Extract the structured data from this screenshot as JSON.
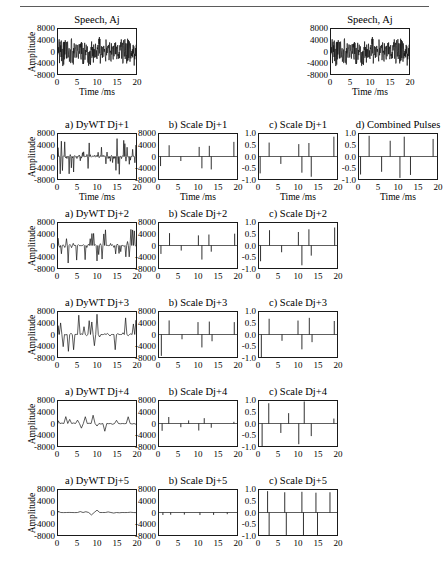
{
  "figure": {
    "axis_titles": {
      "x": "Time /ms",
      "y": "Amplitude"
    },
    "amp_ticks": [
      "8000",
      "4000",
      "0",
      "-4000",
      "-8000"
    ],
    "scale_ticks": [
      "1.0",
      "0.5",
      "0.0",
      "-0.5",
      "-1.0"
    ],
    "x_ticks": [
      "0",
      "5",
      "10",
      "15",
      "20"
    ]
  },
  "header": {
    "left": {
      "title": "Speech, Aj"
    },
    "right": {
      "title": "Speech, Aj"
    }
  },
  "rows": [
    {
      "key": "dj1",
      "panels": [
        {
          "title": "a) DyWT Dj+1",
          "kind": "amp"
        },
        {
          "title": "b) Scale Dj+1",
          "kind": "amp"
        },
        {
          "title": "c) Scale Dj+1",
          "kind": "scale"
        },
        {
          "title": "d) Combined Pulses",
          "kind": "scale"
        }
      ]
    },
    {
      "key": "dj2",
      "panels": [
        {
          "title": "a) DyWT Dj+2",
          "kind": "amp"
        },
        {
          "title": "b) Scale Dj+2",
          "kind": "amp"
        },
        {
          "title": "c) Scale Dj+2",
          "kind": "scale"
        }
      ]
    },
    {
      "key": "dj3",
      "panels": [
        {
          "title": "a) DyWT Dj+3",
          "kind": "amp"
        },
        {
          "title": "b) Scale Dj+3",
          "kind": "amp"
        },
        {
          "title": "c) Scale Dj+3",
          "kind": "scale"
        }
      ]
    },
    {
      "key": "dj4",
      "panels": [
        {
          "title": "a) DyWT Dj+4",
          "kind": "amp"
        },
        {
          "title": "b) Scale Dj+4",
          "kind": "amp"
        },
        {
          "title": "c) Scale Dj+4",
          "kind": "scale"
        }
      ]
    },
    {
      "key": "dj5",
      "panels": [
        {
          "title": "a) DyWT Dj+5",
          "kind": "amp"
        },
        {
          "title": "b) Scale Dj+5",
          "kind": "amp"
        },
        {
          "title": "c) Scale Dj+5",
          "kind": "scale"
        }
      ]
    }
  ],
  "chart_data": {
    "type": "line",
    "xlabel": "Time /ms",
    "ylabel": "Amplitude",
    "xlim": [
      0,
      20
    ],
    "x_ticks": [
      0,
      5,
      10,
      15,
      20
    ],
    "amplitude_ylim": [
      -8000,
      8000
    ],
    "amplitude_yticks": [
      8000,
      4000,
      0,
      -4000,
      -8000
    ],
    "scale_ylim": [
      -1.0,
      1.0
    ],
    "scale_yticks": [
      1.0,
      0.5,
      0.0,
      -0.5,
      -1.0
    ],
    "grid": false,
    "legend": "none",
    "panels": [
      {
        "id": "speech-left",
        "title": "Speech, Aj",
        "ylabel": "Amplitude",
        "ylim": [
          -8000,
          8000
        ],
        "series_type": "waveform",
        "description": "Noisy speech waveform oscillating roughly between -5500 and 5500 over 0-20 ms"
      },
      {
        "id": "speech-right",
        "title": "Speech, Aj",
        "ylabel": "Amplitude",
        "ylim": [
          -8000,
          8000
        ],
        "series_type": "waveform",
        "description": "Same speech waveform repeated at right of header row"
      },
      {
        "id": "dj1-a",
        "title": "a) DyWT Dj+1",
        "ylim": [
          -8000,
          8000
        ],
        "series_type": "wavelet-detail",
        "description": "Dense high-frequency detail coefficients, spikes up to about +6000 near 9 ms and 19 ms"
      },
      {
        "id": "dj1-b",
        "title": "b) Scale Dj+1",
        "ylim": [
          -8000,
          8000
        ],
        "series_type": "pulses",
        "pulses": [
          {
            "t": 0.4,
            "v": -3400
          },
          {
            "t": 2.6,
            "v": 4000
          },
          {
            "t": 5.6,
            "v": -1600
          },
          {
            "t": 10.3,
            "v": 3400
          },
          {
            "t": 11.0,
            "v": -4200
          },
          {
            "t": 12.9,
            "v": 3800
          },
          {
            "t": 13.4,
            "v": -4600
          },
          {
            "t": 19.2,
            "v": 5200
          }
        ]
      },
      {
        "id": "dj1-c",
        "title": "c) Scale Dj+1",
        "ylim": [
          -1.0,
          1.0
        ],
        "series_type": "pulses",
        "pulses": [
          {
            "t": 0.3,
            "v": -0.75
          },
          {
            "t": 2.6,
            "v": 0.62
          },
          {
            "t": 5.6,
            "v": -0.33
          },
          {
            "t": 10.2,
            "v": 0.55
          },
          {
            "t": 11.0,
            "v": -0.72
          },
          {
            "t": 12.8,
            "v": 0.6
          },
          {
            "t": 13.4,
            "v": -0.9
          },
          {
            "t": 19.2,
            "v": 0.88
          }
        ]
      },
      {
        "id": "dj1-d",
        "title": "d) Combined Pulses",
        "ylim": [
          -1.0,
          1.0
        ],
        "series_type": "pulses",
        "pulses": [
          {
            "t": 0.4,
            "v": -0.8
          },
          {
            "t": 2.6,
            "v": 0.92
          },
          {
            "t": 5.8,
            "v": -0.68
          },
          {
            "t": 8.0,
            "v": 0.7
          },
          {
            "t": 10.5,
            "v": -0.95
          },
          {
            "t": 11.6,
            "v": 0.88
          },
          {
            "t": 13.2,
            "v": -0.82
          },
          {
            "t": 19.0,
            "v": 0.78
          }
        ]
      },
      {
        "id": "dj2-a",
        "title": "a) DyWT Dj+2",
        "ylim": [
          -8000,
          8000
        ],
        "series_type": "wavelet-detail",
        "description": "Detail coefficients at scale j+2, spikes reaching about +/-6500"
      },
      {
        "id": "dj2-b",
        "title": "b) Scale Dj+2",
        "ylim": [
          -8000,
          8000
        ],
        "series_type": "pulses",
        "pulses": [
          {
            "t": 0.5,
            "v": -3000
          },
          {
            "t": 2.7,
            "v": 4400
          },
          {
            "t": 5.7,
            "v": -1800
          },
          {
            "t": 10.1,
            "v": 3600
          },
          {
            "t": 11.0,
            "v": -5000
          },
          {
            "t": 12.8,
            "v": 3900
          },
          {
            "t": 13.4,
            "v": -2200
          },
          {
            "t": 19.4,
            "v": 4200
          }
        ]
      },
      {
        "id": "dj2-c",
        "title": "c) Scale Dj+2",
        "ylim": [
          -1.0,
          1.0
        ],
        "series_type": "pulses",
        "pulses": [
          {
            "t": 0.4,
            "v": -0.7
          },
          {
            "t": 2.7,
            "v": 0.68
          },
          {
            "t": 5.8,
            "v": -0.3
          },
          {
            "t": 10.1,
            "v": 0.6
          },
          {
            "t": 11.0,
            "v": -0.88
          },
          {
            "t": 12.8,
            "v": 0.72
          },
          {
            "t": 13.4,
            "v": -0.45
          },
          {
            "t": 19.4,
            "v": 0.8
          }
        ]
      },
      {
        "id": "dj3-a",
        "title": "a) DyWT Dj+3",
        "ylim": [
          -8000,
          8000
        ],
        "series_type": "wavelet-detail",
        "description": "Sparser, larger detail pulses reaching about -8000 near 11 ms"
      },
      {
        "id": "dj3-b",
        "title": "b) Scale Dj+3",
        "ylim": [
          -8000,
          8000
        ],
        "series_type": "pulses",
        "pulses": [
          {
            "t": 0.6,
            "v": -7600
          },
          {
            "t": 2.6,
            "v": 5000
          },
          {
            "t": 5.9,
            "v": -1700
          },
          {
            "t": 10.0,
            "v": 4400
          },
          {
            "t": 11.0,
            "v": -4600
          },
          {
            "t": 12.9,
            "v": 4600
          },
          {
            "t": 13.6,
            "v": -2400
          },
          {
            "t": 19.3,
            "v": 4400
          }
        ]
      },
      {
        "id": "dj3-c",
        "title": "c) Scale Dj+3",
        "ylim": [
          -1.0,
          1.0
        ],
        "series_type": "pulses",
        "pulses": [
          {
            "t": 0.6,
            "v": -1.0
          },
          {
            "t": 2.6,
            "v": 0.7
          },
          {
            "t": 5.9,
            "v": -0.28
          },
          {
            "t": 10.0,
            "v": 0.62
          },
          {
            "t": 11.0,
            "v": -0.66
          },
          {
            "t": 12.9,
            "v": 0.74
          },
          {
            "t": 13.6,
            "v": -0.34
          },
          {
            "t": 19.3,
            "v": 0.6
          }
        ]
      },
      {
        "id": "dj4-a",
        "title": "a) DyWT Dj+4",
        "ylim": [
          -8000,
          8000
        ],
        "series_type": "wavelet-detail",
        "description": "Low-amplitude detail coefficients, mostly within +/-3000"
      },
      {
        "id": "dj4-b",
        "title": "b) Scale Dj+4",
        "ylim": [
          -8000,
          8000
        ],
        "series_type": "pulses",
        "pulses": [
          {
            "t": 0.8,
            "v": -2600
          },
          {
            "t": 2.5,
            "v": 2300
          },
          {
            "t": 5.6,
            "v": -1300
          },
          {
            "t": 7.6,
            "v": 1100
          },
          {
            "t": 10.2,
            "v": -2500
          },
          {
            "t": 11.6,
            "v": 1900
          },
          {
            "t": 13.4,
            "v": -1500
          },
          {
            "t": 19.2,
            "v": 600
          }
        ]
      },
      {
        "id": "dj4-c",
        "title": "c) Scale Dj+4",
        "ylim": [
          -1.0,
          1.0
        ],
        "series_type": "pulses",
        "pulses": [
          {
            "t": 0.8,
            "v": -1.0
          },
          {
            "t": 2.5,
            "v": 0.9
          },
          {
            "t": 5.6,
            "v": -0.42
          },
          {
            "t": 7.6,
            "v": 0.46
          },
          {
            "t": 10.2,
            "v": -0.92
          },
          {
            "t": 11.6,
            "v": 0.98
          },
          {
            "t": 13.4,
            "v": -0.56
          },
          {
            "t": 19.2,
            "v": 0.22
          }
        ]
      },
      {
        "id": "dj5-a",
        "title": "a) DyWT Dj+5",
        "ylim": [
          -8000,
          8000
        ],
        "series_type": "wavelet-detail",
        "description": "Very low amplitude residual detail, within about +/-1200"
      },
      {
        "id": "dj5-b",
        "title": "b) Scale Dj+5",
        "ylim": [
          -8000,
          8000
        ],
        "series_type": "pulses",
        "pulses": [
          {
            "t": 1.0,
            "v": -900
          },
          {
            "t": 3.0,
            "v": -800
          },
          {
            "t": 6.5,
            "v": -750
          },
          {
            "t": 10.5,
            "v": -900
          },
          {
            "t": 14.0,
            "v": -850
          },
          {
            "t": 17.5,
            "v": -600
          }
        ]
      },
      {
        "id": "dj5-c",
        "title": "c) Scale Dj+5",
        "ylim": [
          -1.0,
          1.0
        ],
        "series_type": "pulses",
        "pulses": [
          {
            "t": 2.2,
            "v": 0.95
          },
          {
            "t": 2.6,
            "v": -1.0
          },
          {
            "t": 6.6,
            "v": 0.9
          },
          {
            "t": 7.0,
            "v": -1.0
          },
          {
            "t": 11.0,
            "v": 0.92
          },
          {
            "t": 11.4,
            "v": -1.0
          },
          {
            "t": 14.6,
            "v": 0.88
          },
          {
            "t": 15.0,
            "v": -1.0
          },
          {
            "t": 18.2,
            "v": 0.9
          }
        ]
      }
    ]
  }
}
